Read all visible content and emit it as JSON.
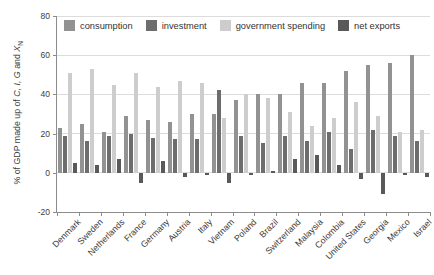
{
  "page": {
    "background": "#ffffff"
  },
  "axis": {
    "ytick_labels": [
      "80",
      "60",
      "40",
      "20",
      "0",
      "-20"
    ],
    "ylabel_parts": [
      "% of GDP made up of ",
      "C, I, G",
      " and ",
      "X",
      "N"
    ]
  },
  "chart_data": {
    "type": "bar",
    "title": "",
    "ylabel": "% of GDP made up of C, I, G and XN",
    "ylim": [
      -20,
      80
    ],
    "yticks": [
      80,
      60,
      40,
      20,
      0,
      -20
    ],
    "grid": true,
    "legend_position": "top",
    "categories": [
      "Denmark",
      "Sweden",
      "Netherlands",
      "France",
      "Germany",
      "Austria",
      "Italy",
      "Vietnam",
      "Poland",
      "Brazil",
      "Switzerland",
      "Malaysia",
      "Colombia",
      "United States",
      "Georgia",
      "Mexico",
      "Israel"
    ],
    "series": [
      {
        "name": "consumption",
        "color": "#929292",
        "values": [
          23,
          25,
          21,
          29,
          27,
          26,
          30,
          30,
          37,
          40,
          40,
          46,
          46,
          52,
          55,
          56,
          60
        ]
      },
      {
        "name": "investment",
        "color": "#6d6d6d",
        "values": [
          19,
          16,
          19,
          20,
          18,
          17,
          17,
          42,
          19,
          15,
          19,
          16,
          21,
          12,
          22,
          19,
          16
        ]
      },
      {
        "name": "government spending",
        "color": "#cdcdcd",
        "values": [
          51,
          53,
          45,
          51,
          44,
          47,
          46,
          28,
          40,
          38,
          31,
          24,
          28,
          36,
          29,
          21,
          22
        ]
      },
      {
        "name": "net exports",
        "color": "#595959",
        "values": [
          5,
          4,
          7,
          -5,
          6,
          -2,
          -1,
          -5,
          -1,
          1,
          7,
          9,
          4,
          -3,
          -11,
          -1,
          -2
        ]
      }
    ]
  },
  "colors": {
    "axis": "#8c8c8c",
    "grid": "#dcdcdc",
    "text": "#3d3d3d"
  }
}
